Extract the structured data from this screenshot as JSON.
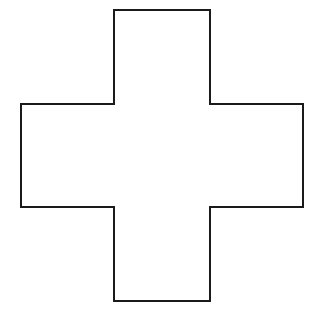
{
  "canvas": {
    "width": 324,
    "height": 316,
    "background_color": "#ffffff"
  },
  "figure": {
    "name": "cross-shape",
    "shape_type": "cross",
    "fill_color": "#ffffff",
    "stroke_color": "#1a1a1a",
    "stroke_width": 2,
    "vertical_bar": {
      "left": 114,
      "right": 210,
      "top": 10,
      "bottom": 301,
      "width": 96,
      "height": 291
    },
    "horizontal_bar": {
      "left": 21,
      "right": 303,
      "top": 104,
      "bottom": 207,
      "width": 282,
      "height": 103
    },
    "vertex_count": 12,
    "points": "114,10 210,10 210,104 303,104 303,207 210,207 210,301 114,301 114,207 21,207 21,104 114,104"
  }
}
